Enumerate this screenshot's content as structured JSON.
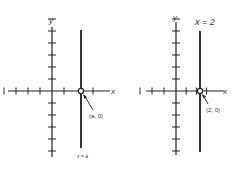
{
  "diagrams": [
    {
      "name": "general",
      "y_label": "y",
      "x_label": "x",
      "point_label": "(a, 0)",
      "line_label": "x = a",
      "line_x_value": "a",
      "ticks_left": 4,
      "ticks_right": 3,
      "ticks_up": 6,
      "ticks_down": 5
    },
    {
      "name": "specific",
      "y_label": "y",
      "x_label": "x",
      "point_label": "(2, 0)",
      "line_label": "x = 2",
      "line_x_value": 2,
      "ticks_left": 3,
      "ticks_right": 3,
      "ticks_up": 6,
      "ticks_down": 5
    }
  ],
  "colors": {
    "ink": "#222222",
    "line": "#333333"
  }
}
